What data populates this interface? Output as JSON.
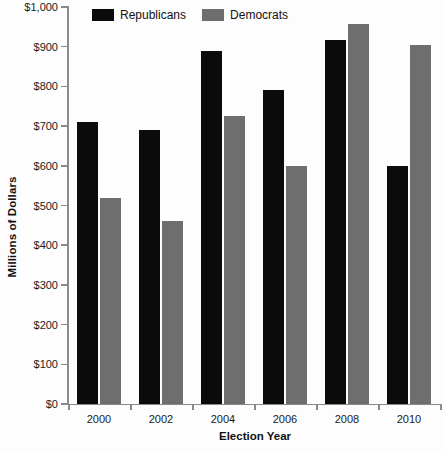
{
  "chart_data": {
    "type": "bar",
    "title": "",
    "subtitle": "",
    "xlabel": "Election Year",
    "ylabel": "Millions of Dollars",
    "categories": [
      "2000",
      "2002",
      "2004",
      "2006",
      "2008",
      "2010"
    ],
    "series": [
      {
        "name": "Republicans",
        "color": "#0b0b0b",
        "values": [
          710,
          690,
          890,
          790,
          918,
          600
        ]
      },
      {
        "name": "Democrats",
        "color": "#6e6e6e",
        "values": [
          520,
          460,
          725,
          600,
          957,
          905
        ]
      }
    ],
    "ylim": [
      0,
      1000
    ],
    "ytick_values": [
      0,
      100,
      200,
      300,
      400,
      500,
      600,
      700,
      800,
      900,
      1000
    ],
    "ytick_labels": [
      "$0",
      "$100",
      "$200",
      "$300",
      "$400",
      "$500",
      "$600",
      "$700",
      "$800",
      "$900",
      "$1,000"
    ],
    "grid": false,
    "legend_position": "top-left",
    "legend_entries": [
      "Republicans",
      "Democrats"
    ],
    "background_color": "#fdfdfd",
    "axis_color": "#8a8a8a"
  }
}
